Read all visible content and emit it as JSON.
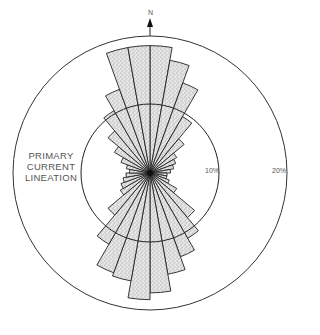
{
  "diagram": {
    "type": "rose",
    "north_label": "N",
    "title_label": [
      "PRIMARY",
      "CURRENT",
      "LINEATION"
    ],
    "rings": [
      {
        "value": 10,
        "label": "10%"
      },
      {
        "value": 20,
        "label": "20%"
      }
    ],
    "sector_width_deg": 10,
    "center": {
      "x": 150,
      "y": 173
    },
    "px_per_percent": 6.85,
    "fill_color": "#d8d8d8",
    "stroke_color": "#222222",
    "sectors": [
      {
        "from": 0,
        "to": 10,
        "percent": 18.6
      },
      {
        "from": 10,
        "to": 20,
        "percent": 16.7
      },
      {
        "from": 20,
        "to": 30,
        "percent": 14.0
      },
      {
        "from": 30,
        "to": 40,
        "percent": 9.5
      },
      {
        "from": 40,
        "to": 50,
        "percent": 6.5
      },
      {
        "from": 50,
        "to": 60,
        "percent": 4.5
      },
      {
        "from": 60,
        "to": 70,
        "percent": 4.0
      },
      {
        "from": 70,
        "to": 80,
        "percent": 3.5
      },
      {
        "from": 80,
        "to": 90,
        "percent": 3.0
      },
      {
        "from": 90,
        "to": 100,
        "percent": 2.5
      },
      {
        "from": 100,
        "to": 110,
        "percent": 2.5
      },
      {
        "from": 110,
        "to": 120,
        "percent": 3.0
      },
      {
        "from": 120,
        "to": 130,
        "percent": 4.5
      },
      {
        "from": 130,
        "to": 140,
        "percent": 8.5
      },
      {
        "from": 140,
        "to": 150,
        "percent": 11.0
      },
      {
        "from": 150,
        "to": 160,
        "percent": 13.0
      },
      {
        "from": 160,
        "to": 170,
        "percent": 15.0
      },
      {
        "from": 170,
        "to": 180,
        "percent": 17.5
      },
      {
        "from": 180,
        "to": 190,
        "percent": 18.5
      },
      {
        "from": 190,
        "to": 200,
        "percent": 16.0
      },
      {
        "from": 200,
        "to": 210,
        "percent": 15.5
      },
      {
        "from": 210,
        "to": 220,
        "percent": 12.0
      },
      {
        "from": 220,
        "to": 230,
        "percent": 8.0
      },
      {
        "from": 230,
        "to": 240,
        "percent": 5.0
      },
      {
        "from": 240,
        "to": 250,
        "percent": 4.5
      },
      {
        "from": 250,
        "to": 260,
        "percent": 4.0
      },
      {
        "from": 260,
        "to": 270,
        "percent": 3.5
      },
      {
        "from": 270,
        "to": 280,
        "percent": 3.0
      },
      {
        "from": 280,
        "to": 290,
        "percent": 3.5
      },
      {
        "from": 290,
        "to": 300,
        "percent": 4.5
      },
      {
        "from": 300,
        "to": 310,
        "percent": 6.0
      },
      {
        "from": 310,
        "to": 320,
        "percent": 8.0
      },
      {
        "from": 320,
        "to": 330,
        "percent": 10.5
      },
      {
        "from": 330,
        "to": 340,
        "percent": 13.0
      },
      {
        "from": 340,
        "to": 350,
        "percent": 18.6
      },
      {
        "from": 350,
        "to": 360,
        "percent": 18.6
      }
    ]
  },
  "chart_data": {
    "type": "rose",
    "title": "PRIMARY CURRENT LINEATION",
    "rlabels": [
      "10%",
      "20%"
    ],
    "rlim": [
      0,
      20
    ],
    "theta_zero": "N",
    "bin_width_deg": 10
  }
}
